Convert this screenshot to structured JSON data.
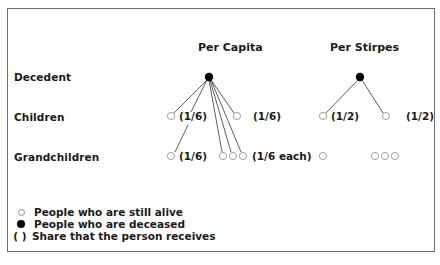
{
  "figure": {
    "frame_color": "#6e6e6e",
    "sections": [
      {
        "heading": "Per Capita",
        "decedent": {
          "status": "deceased"
        },
        "children": [
          {
            "status": "alive",
            "share": "(1/6)"
          },
          {
            "status": "alive",
            "share": "(1/6)"
          }
        ],
        "grandchildren_groups": [
          {
            "count": 1,
            "status": "alive",
            "share": "(1/6)"
          },
          {
            "count": 3,
            "status": "alive",
            "share": "(1/6 each)"
          }
        ]
      },
      {
        "heading": "Per Stirpes",
        "decedent": {
          "status": "deceased"
        },
        "children": [
          {
            "status": "alive",
            "share": "(1/2)"
          },
          {
            "status": "alive",
            "share": "(1/2)"
          }
        ],
        "grandchildren_groups": [
          {
            "count": 1,
            "status": "alive",
            "share": ""
          },
          {
            "count": 3,
            "status": "alive",
            "share": ""
          }
        ]
      }
    ],
    "row_labels": {
      "decedent": "Decedent",
      "children": "Children",
      "grandchildren": "Grandchildren"
    },
    "legend": {
      "alive": {
        "symbol": "open-circle",
        "label": "People who are still alive"
      },
      "deceased": {
        "symbol": "filled-circle",
        "label": "People who are deceased"
      },
      "share": {
        "symbol": "(   )",
        "label": "Share that the person receives"
      }
    }
  }
}
